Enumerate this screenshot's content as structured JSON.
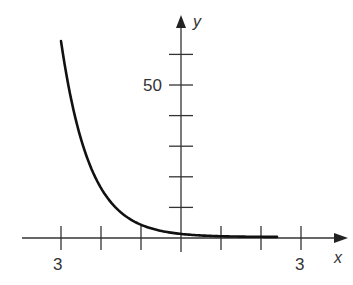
{
  "chart_data": {
    "type": "line",
    "title": "",
    "xlabel": "x",
    "ylabel": "y",
    "function": "y = (1/4)^x",
    "x": [
      -3,
      -2.5,
      -2,
      -1.5,
      -1,
      -0.5,
      0,
      0.5,
      1,
      1.5,
      2,
      2.4
    ],
    "series": [
      {
        "name": "curve",
        "values": [
          64,
          32,
          16,
          8,
          4,
          2,
          1,
          0.5,
          0.25,
          0.125,
          0.0625,
          0.036
        ]
      }
    ],
    "xlim": [
      -3.9,
      4.2
    ],
    "ylim": [
      0,
      65
    ],
    "x_ticks": [
      -3,
      -2,
      -1,
      1,
      2,
      3
    ],
    "x_tick_labels": [
      {
        "value": -3,
        "text": "3"
      },
      {
        "value": 3,
        "text": "3"
      }
    ],
    "y_ticks": [
      10,
      20,
      30,
      40,
      50,
      60
    ],
    "y_tick_labels": [
      {
        "value": 50,
        "text": "50"
      }
    ],
    "grid": false,
    "legend": null
  },
  "labels": {
    "x_axis": "x",
    "y_axis": "y",
    "x_neg3": "3",
    "x_pos3": "3",
    "y_50": "50"
  }
}
